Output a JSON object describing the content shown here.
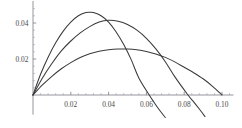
{
  "chart_data": {
    "type": "line",
    "title": "",
    "subtitle": "",
    "xlabel": "",
    "ylabel": "",
    "xlim": [
      0.0,
      0.105
    ],
    "ylim": [
      -0.012,
      0.05
    ],
    "grid": false,
    "legend": "none",
    "background_color": "#ffffff",
    "curve_color": "#3a3a3a",
    "axis_color": "#7a7a86",
    "x_ticks": [
      0.02,
      0.04,
      0.06,
      0.08,
      0.1
    ],
    "x_tick_labels": [
      "0.02",
      "0.04",
      "0.06",
      "0.08",
      "0.10"
    ],
    "x_minor_tick_count_per_interval": 4,
    "y_ticks": [
      0.02,
      0.04
    ],
    "y_tick_labels": [
      "0.02",
      "0.04"
    ],
    "y_minor_tick_count_per_interval": 4,
    "series": [
      {
        "name": "curve-1",
        "peak_x": 0.03,
        "peak_y": 0.046,
        "zero_crossing_x": 0.0615,
        "end_x": 0.07,
        "end_y": -0.0115,
        "x": [
          0.0,
          0.004,
          0.008,
          0.012,
          0.016,
          0.02,
          0.024,
          0.028,
          0.03,
          0.032,
          0.036,
          0.04,
          0.044,
          0.048,
          0.052,
          0.056,
          0.0615,
          0.064,
          0.067,
          0.07
        ],
        "y": [
          0.0,
          0.0115,
          0.021,
          0.029,
          0.0355,
          0.0405,
          0.044,
          0.0458,
          0.046,
          0.0458,
          0.044,
          0.0405,
          0.035,
          0.028,
          0.0195,
          0.0095,
          0.0,
          -0.004,
          -0.0085,
          -0.0125
        ]
      },
      {
        "name": "curve-2",
        "peak_x": 0.04,
        "peak_y": 0.0415,
        "zero_crossing_x": 0.082,
        "end_x": 0.091,
        "end_y": -0.0115,
        "x": [
          0.0,
          0.005,
          0.01,
          0.015,
          0.02,
          0.025,
          0.03,
          0.035,
          0.04,
          0.045,
          0.05,
          0.055,
          0.06,
          0.065,
          0.07,
          0.075,
          0.082,
          0.085,
          0.088,
          0.091
        ],
        "y": [
          0.0,
          0.0095,
          0.0175,
          0.0245,
          0.03,
          0.0345,
          0.038,
          0.0405,
          0.0415,
          0.041,
          0.0392,
          0.036,
          0.0315,
          0.0256,
          0.0185,
          0.0102,
          0.0,
          -0.0038,
          -0.0078,
          -0.012
        ]
      },
      {
        "name": "curve-3",
        "peak_x": 0.05,
        "peak_y": 0.0255,
        "zero_crossing_x": 0.1,
        "end_x": 0.1,
        "end_y": 0.0,
        "x": [
          0.0,
          0.005,
          0.01,
          0.015,
          0.02,
          0.025,
          0.03,
          0.035,
          0.04,
          0.045,
          0.05,
          0.055,
          0.06,
          0.065,
          0.07,
          0.075,
          0.08,
          0.085,
          0.09,
          0.095,
          0.1
        ],
        "y": [
          0.0,
          0.0056,
          0.0104,
          0.0146,
          0.018,
          0.0208,
          0.0229,
          0.0243,
          0.0251,
          0.0255,
          0.0255,
          0.0251,
          0.0242,
          0.0228,
          0.0209,
          0.0184,
          0.0154,
          0.0124,
          0.009,
          0.0048,
          0.0
        ]
      }
    ]
  }
}
